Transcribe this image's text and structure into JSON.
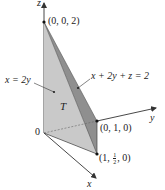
{
  "figure": {
    "axes": {
      "x_label": "x",
      "y_label": "y",
      "z_label": "z",
      "origin_label": "0"
    },
    "points": [
      {
        "name": "apex",
        "label": "(0, 0, 2)"
      },
      {
        "name": "y-intercept",
        "label": "(0, 1, 0)"
      },
      {
        "name": "corner",
        "label_prefix": "(1, ",
        "frac_num": "1",
        "frac_den": "2",
        "label_suffix": ", 0)"
      }
    ],
    "plane_labels": {
      "left_plane": "x = 2y",
      "right_plane": "x + 2y + z = 2"
    },
    "region_label": "T",
    "colors": {
      "light_face": "#c9c9c9",
      "dark_face": "#8f8f8f",
      "bottom_face": "#b4b4b4",
      "axis": "#333333",
      "text": "#222222"
    }
  }
}
